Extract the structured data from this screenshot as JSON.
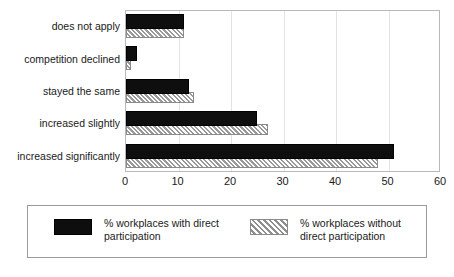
{
  "chart_data": {
    "type": "bar",
    "orientation": "horizontal",
    "title": "",
    "xlabel": "",
    "ylabel": "",
    "xlim": [
      0,
      60
    ],
    "xticks": [
      0,
      10,
      20,
      30,
      40,
      50,
      60
    ],
    "grid": true,
    "legend_position": "bottom",
    "categories": [
      "does not apply",
      "competition declined",
      "stayed the same",
      "increased slightly",
      "increased significantly"
    ],
    "series": [
      {
        "name": "% workplaces with direct\nparticipation",
        "legend_label": "% workplaces with direct\nparticipation",
        "style": "solid-black",
        "color": "#0e0e0e",
        "values": [
          11,
          2,
          12,
          25,
          51
        ]
      },
      {
        "name": "% workplaces without\ndirect participation",
        "legend_label": "% workplaces without\ndirect participation",
        "style": "hatched-gray",
        "color": "#d9d9d9",
        "values": [
          11,
          1,
          13,
          27,
          48
        ]
      }
    ]
  },
  "colors": {
    "series_solid": "#0e0e0e",
    "series_hatch_fill": "#d9d9d9",
    "series_hatch_line": "#8f8f8f",
    "gridline": "#e3e3e3",
    "frame": "#b9b9b9",
    "legend_border": "#9a9a9a",
    "text": "#1a1a1a"
  }
}
